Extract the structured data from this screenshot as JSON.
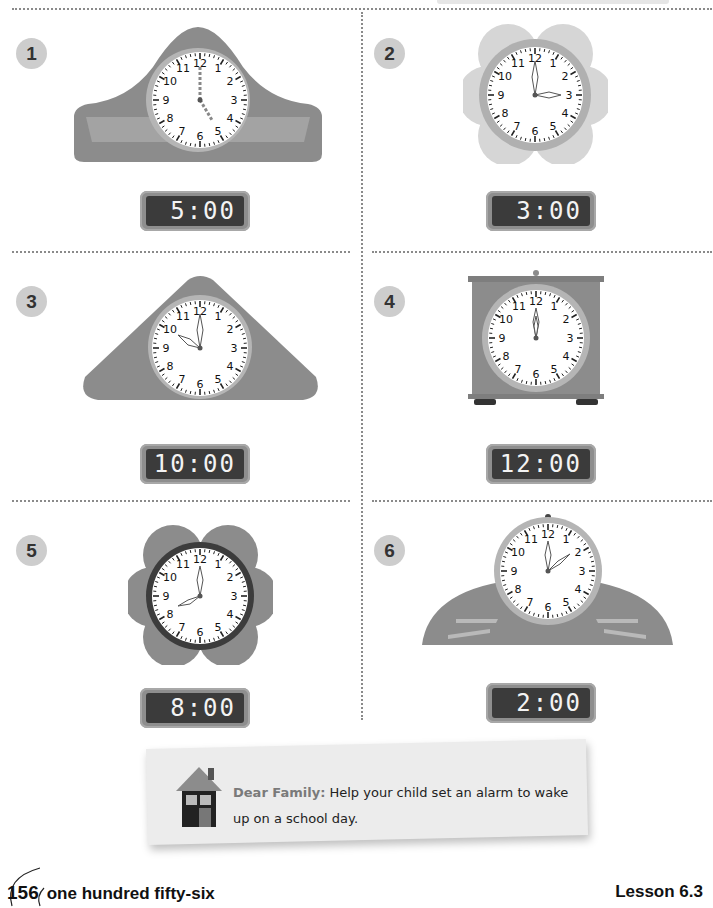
{
  "page": {
    "number": "156",
    "number_words": "one hundred fifty-six",
    "lesson": "Lesson 6.3"
  },
  "problems": [
    {
      "number": "1",
      "digital_time": "5:00",
      "hour": 5,
      "minute": 0,
      "clock_style": "mantel-arched",
      "hands_style": "dashed"
    },
    {
      "number": "2",
      "digital_time": "3:00",
      "hour": 3,
      "minute": 0,
      "clock_style": "flower-light",
      "hands_style": "solid"
    },
    {
      "number": "3",
      "digital_time": "10:00",
      "hour": 10,
      "minute": 0,
      "clock_style": "triangle",
      "hands_style": "solid"
    },
    {
      "number": "4",
      "digital_time": "12:00",
      "hour": 12,
      "minute": 0,
      "clock_style": "square-box",
      "hands_style": "solid"
    },
    {
      "number": "5",
      "digital_time": "8:00",
      "hour": 8,
      "minute": 0,
      "clock_style": "flower-dark",
      "hands_style": "solid"
    },
    {
      "number": "6",
      "digital_time": "2:00",
      "hour": 2,
      "minute": 0,
      "clock_style": "half-dome",
      "hands_style": "solid"
    }
  ],
  "family_note": {
    "lead": "Dear Family:",
    "text": "Help your child set an alarm to wake up on a school day."
  },
  "colors": {
    "clock_body": "#8c8c8c",
    "clock_rim": "#b5b5b5",
    "badge": "#cdcdcd",
    "digital_screen": "#3b3b3b",
    "note_bg": "#ececec"
  }
}
